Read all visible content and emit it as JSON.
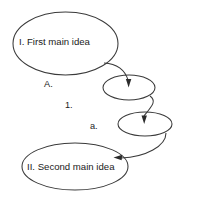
{
  "diagram": {
    "background_color": "#ffffff",
    "stroke_color": "#3a3a3a",
    "text_color": "#1a1a1a",
    "nodes": [
      {
        "id": "main-idea-1",
        "shape": "ellipse",
        "label": "I.  First main idea",
        "level": "roman-1",
        "cx": 65.5,
        "cy": 43.5,
        "rx": 52.5,
        "ry": 31.5
      },
      {
        "id": "sub-node-1",
        "shape": "ellipse",
        "label": "",
        "level": "number-1",
        "cx": 129,
        "cy": 87.5,
        "rx": 26,
        "ry": 12.5
      },
      {
        "id": "sub-node-2",
        "shape": "ellipse",
        "label": "",
        "level": "letter-a",
        "cx": 145,
        "cy": 124,
        "rx": 27,
        "ry": 12
      },
      {
        "id": "main-idea-2",
        "shape": "ellipse",
        "label": "II.  Second main idea",
        "level": "roman-2",
        "cx": 75,
        "cy": 166.5,
        "rx": 53,
        "ry": 23.5
      }
    ],
    "level_markers": [
      {
        "id": "marker-a-upper",
        "label": "A.",
        "x": 44,
        "y": 80
      },
      {
        "id": "marker-one",
        "label": "1.",
        "x": 65,
        "y": 101
      },
      {
        "id": "marker-a-lower",
        "label": "a.",
        "x": 90,
        "y": 122
      }
    ],
    "connectors": [
      {
        "id": "connector-1",
        "from": "main-idea-1",
        "to": "sub-node-1",
        "arrow_direction": "down"
      },
      {
        "id": "connector-2",
        "from": "sub-node-1",
        "to": "sub-node-2",
        "arrow_direction": "down"
      },
      {
        "id": "connector-3",
        "from": "sub-node-2",
        "to": "main-idea-2",
        "arrow_direction": "left"
      }
    ]
  }
}
